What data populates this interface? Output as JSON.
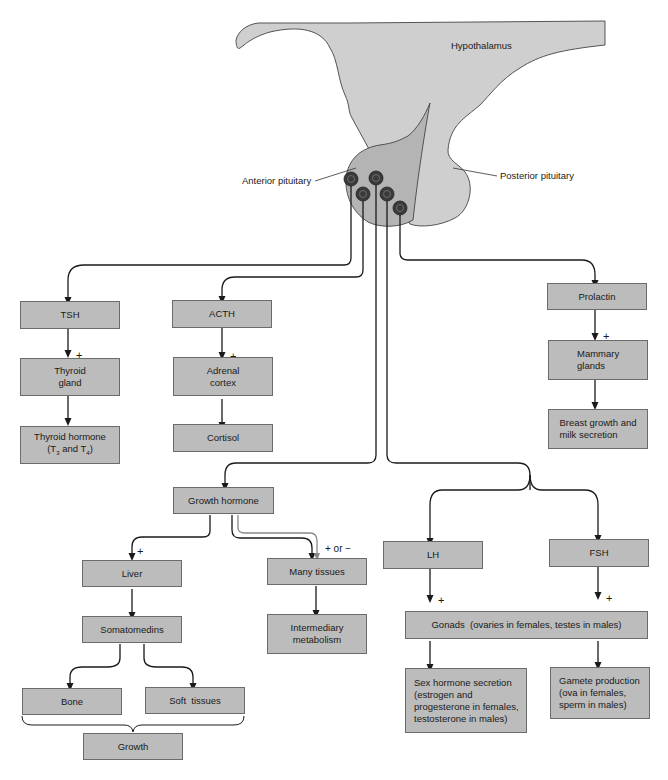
{
  "anatomy": {
    "hypothalamus": "Hypothalamus",
    "anterior_pituitary": "Anterior pituitary",
    "posterior_pituitary": "Posterior pituitary"
  },
  "boxes": {
    "tsh": "TSH",
    "thyroid_gland": [
      "Thyroid",
      "gland"
    ],
    "thyroid_hormone": [
      "Thyroid hormone",
      "(T3 and T4)"
    ],
    "acth": "ACTH",
    "adrenal_cortex": [
      "Adrenal",
      "cortex"
    ],
    "cortisol": "Cortisol",
    "prolactin": "Prolactin",
    "mammary_glands": [
      "Mammary",
      "glands"
    ],
    "breast_growth": [
      "Breast growth and",
      "milk secretion"
    ],
    "growth_hormone": "Growth hormone",
    "liver": "Liver",
    "somatomedins": "Somatomedins",
    "bone": "Bone",
    "soft_tissues": "Soft  tissues",
    "growth": "Growth",
    "many_tissues": "Many tissues",
    "intermediary_metabolism": [
      "Intermediary",
      "metabolism"
    ],
    "lh": "LH",
    "fsh": "FSH",
    "gonads": "Gonads  (ovaries in females, testes in males)",
    "sex_hormone": [
      "Sex hormone secretion",
      "(estrogen and",
      "progesterone in females,",
      "testosterone in males)"
    ],
    "gamete": [
      "Gamete production",
      "(ova in females,",
      "sperm in males)"
    ]
  },
  "signs": {
    "plus": "+",
    "plus_or_minus": "+ or −"
  },
  "colors": {
    "box_fill": "#bcbcbc",
    "hypothalamus_fill": "#cfcfcf",
    "anterior_fill": "#b4b4b4",
    "cell_fill": "#3a3a3a",
    "line": "#1a1a1a"
  }
}
